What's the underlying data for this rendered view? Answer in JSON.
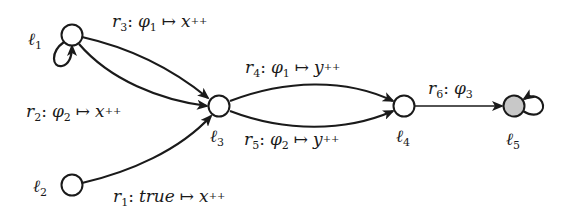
{
  "nodes": [
    {
      "id": "l1",
      "name": "ℓ",
      "sub": "1",
      "x": 72,
      "y": 35,
      "fill": "#ffffff"
    },
    {
      "id": "l2",
      "name": "ℓ",
      "sub": "2",
      "x": 72,
      "y": 185,
      "fill": "#ffffff"
    },
    {
      "id": "l3",
      "name": "ℓ",
      "sub": "3",
      "x": 219,
      "y": 106,
      "fill": "#ffffff"
    },
    {
      "id": "l4",
      "name": "ℓ",
      "sub": "4",
      "x": 404,
      "y": 106,
      "fill": "#ffffff"
    },
    {
      "id": "l5",
      "name": "ℓ",
      "sub": "5",
      "x": 514,
      "y": 106,
      "fill": "#c8c8c8"
    }
  ],
  "edges": {
    "r1": {
      "r": "r",
      "sub": "1",
      "guard": "true",
      "guard_sub": "",
      "arrow": "↦",
      "update": "x",
      "inc": "++"
    },
    "r2": {
      "r": "r",
      "sub": "2",
      "guard": "φ",
      "guard_sub": "2",
      "arrow": "↦",
      "update": "x",
      "inc": "++"
    },
    "r3": {
      "r": "r",
      "sub": "3",
      "guard": "φ",
      "guard_sub": "1",
      "arrow": "↦",
      "update": "x",
      "inc": "++"
    },
    "r4": {
      "r": "r",
      "sub": "4",
      "guard": "φ",
      "guard_sub": "1",
      "arrow": "↦",
      "update": "y",
      "inc": "++"
    },
    "r5": {
      "r": "r",
      "sub": "5",
      "guard": "φ",
      "guard_sub": "2",
      "arrow": "↦",
      "update": "y",
      "inc": "++"
    },
    "r6": {
      "r": "r",
      "sub": "6",
      "guard": "φ",
      "guard_sub": "3"
    }
  },
  "colon": ":"
}
